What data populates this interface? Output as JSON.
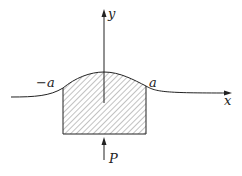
{
  "diagram": {
    "labels": {
      "y_axis": "y",
      "x_axis": "x",
      "neg_a": "−a",
      "pos_a": "a",
      "force": "P"
    },
    "colors": {
      "stroke": "#222222",
      "hatch": "#555555",
      "background": "#ffffff"
    }
  }
}
